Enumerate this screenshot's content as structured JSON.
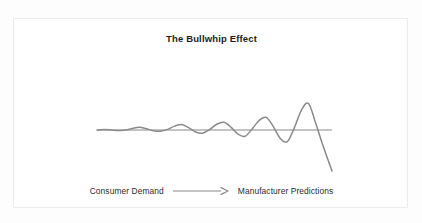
{
  "card": {
    "background": "#ffffff",
    "border_color": "#ececec"
  },
  "chart_data": {
    "type": "line",
    "title": "The Bullwhip Effect",
    "xlabel": "",
    "ylabel": "",
    "grid": false,
    "legend": "none",
    "baseline_value": 0,
    "line_color": "#8a8a8a",
    "baseline_color": "#8a8a8a",
    "xlim": [
      0,
      100
    ],
    "ylim": [
      -34,
      30
    ],
    "series": [
      {
        "name": "Order variability",
        "x": [
          0,
          3,
          6,
          9,
          12,
          15,
          18,
          21,
          24,
          27,
          30,
          33,
          36,
          39,
          42,
          45,
          48,
          51,
          54,
          57,
          60,
          63,
          66,
          69,
          72,
          75,
          78,
          81,
          84,
          87,
          90,
          93,
          96,
          100
        ],
        "y": [
          0,
          0.4,
          0,
          -0.5,
          0,
          1.2,
          2.2,
          1.0,
          -0.6,
          -1.0,
          0.5,
          3.2,
          4.5,
          2.0,
          -1.6,
          -2.6,
          0.6,
          4.8,
          6.4,
          2.4,
          -3.4,
          -5.2,
          0.8,
          8.0,
          10.5,
          3.0,
          -7.0,
          -9.6,
          2.0,
          16.5,
          22.0,
          6.0,
          -12.0,
          -34.0
        ]
      },
      {
        "name": "Baseline",
        "x": [
          0,
          100
        ],
        "y": [
          0,
          0
        ]
      }
    ],
    "annotations": [
      {
        "text": "Consumer Demand",
        "position": "bottom-left"
      },
      {
        "text": "Manufacturer Predictions",
        "position": "bottom-right"
      },
      {
        "text": "arrow",
        "position": "bottom-center"
      }
    ]
  },
  "caption": {
    "left_label": "Consumer Demand",
    "right_label": "Manufacturer Predictions",
    "arrow_icon": "right-arrow-icon"
  }
}
